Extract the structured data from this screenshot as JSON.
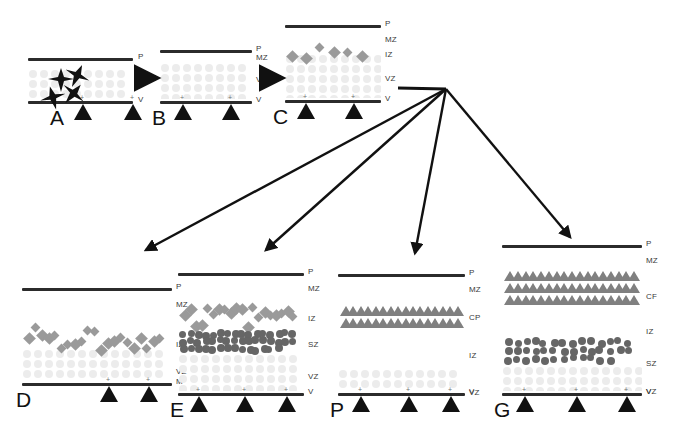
{
  "figure": {
    "type": "diagram",
    "background": "#ffffff"
  },
  "colors": {
    "line": "#2b2b2b",
    "label": "#3a3a3a",
    "letter": "#111111",
    "vz_dot": "#ececec",
    "diamond": "#9a9a9a",
    "circle": "#666666",
    "triangle": "#808080",
    "arrow": "#111111"
  },
  "zone_key": {
    "P": "Pial surface",
    "MZ": "Marginal zone",
    "CP": "Cortical plate",
    "IZ": "Intermediate zone",
    "SZ": "Subventricular zone",
    "VZ": "Ventricular zone",
    "V": "Ventricular surface",
    "M": "Ventricular surface"
  },
  "panels": [
    {
      "id": "A",
      "letter": "A",
      "labels": [
        "P",
        "VZ",
        "V"
      ],
      "cells": {
        "glia": 4,
        "diamonds": 0,
        "circles": 0,
        "triangle_rows": 0
      },
      "basal_triangles": 2
    },
    {
      "id": "B",
      "letter": "B",
      "labels": [
        "P",
        "MZ",
        "VZ",
        "V"
      ],
      "cells": {
        "glia": 0,
        "diamonds": 0,
        "circles": 0,
        "triangle_rows": 0
      },
      "basal_triangles": 2
    },
    {
      "id": "C",
      "letter": "C",
      "labels": [
        "P",
        "MZ",
        "IZ",
        "VZ",
        "V"
      ],
      "cells": {
        "glia": 0,
        "diamonds": 6,
        "circles": 0,
        "triangle_rows": 0
      },
      "basal_triangles": 2
    },
    {
      "id": "D",
      "letter": "D",
      "labels": [
        "P",
        "MZ",
        "IZ",
        "VZ",
        "M"
      ],
      "cells": {
        "glia": 0,
        "diamonds": 21,
        "circles": 0,
        "triangle_rows": 0
      },
      "basal_triangles": 3
    },
    {
      "id": "E",
      "letter": "E",
      "labels": [
        "P",
        "MZ",
        "IZ",
        "SZ",
        "VZ",
        "V"
      ],
      "cells": {
        "glia": 0,
        "diamonds": 20,
        "circles": 46,
        "triangle_rows": 0
      },
      "basal_triangles": 3
    },
    {
      "id": "F",
      "letter": "P",
      "labels": [
        "P",
        "MZ",
        "CP",
        "IZ",
        "VZ",
        "V"
      ],
      "cells": {
        "glia": 0,
        "diamonds": 0,
        "circles": 0,
        "triangle_rows": 2
      },
      "basal_triangles": 3
    },
    {
      "id": "G",
      "letter": "G",
      "labels": [
        "P",
        "MZ",
        "CF",
        "IZ",
        "SZ",
        "VZ",
        "V"
      ],
      "cells": {
        "glia": 0,
        "diamonds": 0,
        "circles": 40,
        "triangle_rows": 3
      },
      "basal_triangles": 3
    }
  ],
  "arrows": {
    "inline": [
      {
        "from": "A",
        "to": "B"
      },
      {
        "from": "B",
        "to": "C"
      }
    ],
    "fanout": {
      "hub_from": "C",
      "targets": [
        "D",
        "E",
        "F",
        "G"
      ],
      "count": 4
    }
  }
}
